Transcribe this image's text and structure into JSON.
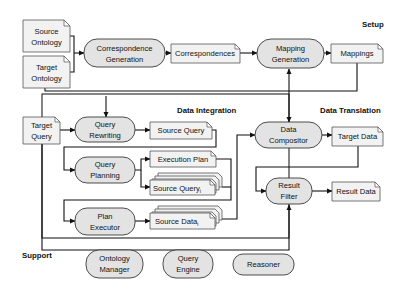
{
  "sections": {
    "setup": "Setup",
    "data_integration": "Data Integration",
    "data_translation": "Data Translation",
    "support": "Support"
  },
  "documents": {
    "source_ontology": [
      "Source",
      "Ontology"
    ],
    "target_ontology": [
      "Target",
      "Ontology"
    ],
    "correspondences": "Correspondences",
    "mappings": "Mappings",
    "target_query": [
      "Target",
      "Query"
    ],
    "source_query": "Source Query",
    "execution_plan": "Execution Plan",
    "source_query_i": "Source Query",
    "source_query_i_sub": "i",
    "source_data_i": "Source Data",
    "source_data_i_sub": "i",
    "target_data": "Target Data",
    "result_data": "Result Data"
  },
  "processes": {
    "correspondence_generation": [
      "Correspondence",
      "Generation"
    ],
    "mapping_generation": [
      "Mapping",
      "Generation"
    ],
    "query_rewriting": [
      "Query",
      "Rewriting"
    ],
    "query_planning": [
      "Query",
      "Planning"
    ],
    "plan_executor": [
      "Plan",
      "Executor"
    ],
    "data_compositor": [
      "Data",
      "Compositor"
    ],
    "result_filter": [
      "Result",
      "Filter"
    ],
    "ontology_manager": [
      "Ontology",
      "Manager"
    ],
    "query_engine": [
      "Query",
      "Engine"
    ],
    "reasoner": "Reasoner"
  },
  "colors": {
    "process_fill": "#e3e3e3",
    "document_fill": "#f2f2f2",
    "line": "#111111"
  }
}
